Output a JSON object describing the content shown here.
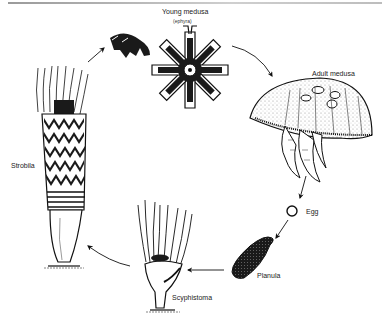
{
  "figure": {
    "stages": [
      {
        "id": "young-medusa",
        "label": "Young medusa",
        "sublabel": "(ephyra)"
      },
      {
        "id": "adult-medusa",
        "label": "Adult medusa"
      },
      {
        "id": "egg",
        "label": "Egg"
      },
      {
        "id": "planula",
        "label": "Planula"
      },
      {
        "id": "scyphistoma",
        "label": "Scyphistoma"
      },
      {
        "id": "strobila",
        "label": "Strobila"
      }
    ],
    "cycle_order": [
      "Young medusa",
      "Adult medusa",
      "Egg",
      "Planula",
      "Scyphistoma",
      "Strobila",
      "Young medusa"
    ],
    "colors": {
      "ink": "#111111",
      "background": "#ffffff",
      "rule": "#9a9a9a"
    }
  }
}
